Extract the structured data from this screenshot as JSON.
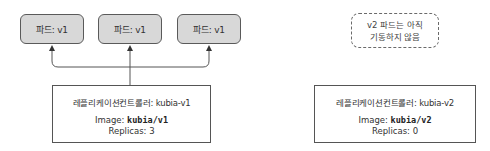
{
  "pods": [
    {
      "label": "파드: v1"
    },
    {
      "label": "파드: v1"
    },
    {
      "label": "파드: v1"
    }
  ],
  "pending_note": {
    "line1": "v2 파드는 아직",
    "line2": "기동하지 않음"
  },
  "controllers": [
    {
      "name": "레플리케이션컨트롤러: kubia-v1",
      "image_label": "Image: ",
      "image_value": "kubia/v1",
      "replicas": "Replicas: 3"
    },
    {
      "name": "레플리케이션컨트롤러: kubia-v2",
      "image_label": "Image: ",
      "image_value": "kubia/v2",
      "replicas": "Replicas: 0"
    }
  ]
}
